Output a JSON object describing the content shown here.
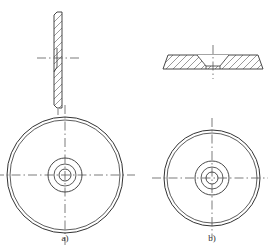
{
  "figure": {
    "kind": "engineering-drawing",
    "line_color": "#333333",
    "hatch_color": "#555555",
    "centerline_color": "#444444",
    "background": "#ffffff"
  },
  "captions": {
    "left": "a)",
    "right": "b)"
  },
  "views": {
    "left_section": {
      "name": "vertical-thin-section",
      "orientation": "vertical",
      "hatched": true,
      "x": 54,
      "y": 12,
      "width": 8,
      "height": 96,
      "hatch_angle_deg": 45,
      "hatch_spacing": 7,
      "bore_top": 48,
      "bore_bottom": 72,
      "bore_depth": 3
    },
    "left_circle": {
      "name": "front-circular-view-a",
      "cx": 65,
      "cy": 175,
      "radii": [
        58,
        55,
        17,
        11,
        6
      ],
      "centerline_extend": 12
    },
    "right_section": {
      "name": "horizontal-flat-section",
      "orientation": "horizontal",
      "hatched": true,
      "x": 163,
      "y": 55,
      "width": 100,
      "height": 14,
      "hatch_angle_deg": 45,
      "hatch_spacing": 7,
      "countersink_half_width": 16,
      "bore_half_width": 7
    },
    "right_circle": {
      "name": "front-circular-view-b",
      "cx": 212,
      "cy": 178,
      "radii": [
        48,
        45,
        17,
        11,
        6
      ],
      "centerline_extend": 12
    }
  },
  "centerlines": {
    "dash_long": 9,
    "dash_gap": 3,
    "dash_dot": 1.5
  }
}
